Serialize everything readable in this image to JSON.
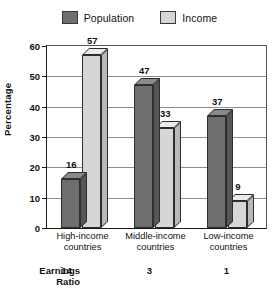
{
  "chart_data": {
    "type": "bar",
    "title": "",
    "subtitle": "",
    "xlabel": "",
    "ylabel": "Percentage",
    "ylim": [
      0,
      60
    ],
    "yticks": [
      0,
      10,
      20,
      30,
      40,
      50,
      60
    ],
    "grid": true,
    "legend_position": "top-center",
    "style": "3d-bars",
    "categories": [
      "High-income countries",
      "Middle-income countries",
      "Low-income countries"
    ],
    "series": [
      {
        "name": "Population",
        "values": [
          16,
          47,
          37
        ],
        "color": "#6e6e6e"
      },
      {
        "name": "Income",
        "values": [
          57,
          33,
          9
        ],
        "color": "#d6d6d6"
      }
    ],
    "annotations": {
      "row_label": "Earnings\nRatio",
      "row_label_line1": "Earnings",
      "row_label_line2": "Ratio",
      "row_values": [
        "14",
        "3",
        "1"
      ]
    }
  },
  "legend": {
    "entries": [
      {
        "label": "Population",
        "swatch_color": "#6e6e6e",
        "icon": "legend-swatch-icon"
      },
      {
        "label": "Income",
        "swatch_color": "#d6d6d6",
        "icon": "legend-swatch-icon"
      }
    ]
  },
  "axis": {
    "y_title": "Percentage",
    "y_ticks": [
      "0",
      "10",
      "20",
      "30",
      "40",
      "50",
      "60"
    ]
  },
  "categories": [
    {
      "line1": "High-income",
      "line2": "countries"
    },
    {
      "line1": "Middle-income",
      "line2": "countries"
    },
    {
      "line1": "Low-income",
      "line2": "countries"
    }
  ],
  "bar_labels": {
    "g0s0": "16",
    "g0s1": "57",
    "g1s0": "47",
    "g1s1": "33",
    "g2s0": "37",
    "g2s1": "9"
  },
  "ratio": {
    "title_line1": "Earnings",
    "title_line2": "Ratio",
    "v0": "14",
    "v1": "3",
    "v2": "1"
  },
  "colors": {
    "population": "#6e6e6e",
    "population_top": "#8a8a8a",
    "population_side": "#565656",
    "income": "#d6d6d6",
    "income_top": "#ebebeb",
    "income_side": "#b9b9b9",
    "axis": "#1a1a1a",
    "grid": "#8d8d8d"
  }
}
